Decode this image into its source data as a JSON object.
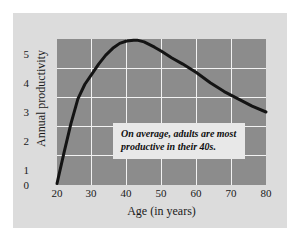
{
  "figure": {
    "card_background": "#dcdcdc",
    "page_background": "#ffffff"
  },
  "callout": {
    "line1": "On average, adults are most",
    "line2": "productive in their 40s.",
    "background": "#e8e8e8"
  },
  "chart_data": {
    "type": "line",
    "title": "",
    "xlabel": "Age (in years)",
    "ylabel": "Annual productivity",
    "xlim": [
      20,
      80
    ],
    "ylim": [
      0,
      5
    ],
    "xticks": [
      20,
      30,
      40,
      50,
      60,
      70,
      80
    ],
    "yticks": [
      0,
      1,
      2,
      3,
      4,
      5
    ],
    "xtick_labels": [
      "20",
      "30",
      "40",
      "50",
      "60",
      "70",
      "80"
    ],
    "ytick_labels": [
      "0",
      "1",
      "2",
      "3",
      "4",
      "5"
    ],
    "grid": true,
    "grid_color": "#f2f2f2",
    "plot_background": "#8c8c8c",
    "legend": false,
    "series": [
      {
        "name": "Annual productivity",
        "color": "#141414",
        "line_width": 3,
        "x": [
          20,
          22,
          24,
          26,
          28,
          30,
          32,
          34,
          36,
          38,
          40,
          42,
          43,
          45,
          48,
          50,
          53,
          56,
          60,
          64,
          68,
          72,
          76,
          80
        ],
        "values": [
          0.05,
          1.1,
          2.1,
          2.95,
          3.45,
          3.8,
          4.15,
          4.45,
          4.68,
          4.85,
          4.93,
          4.96,
          4.96,
          4.9,
          4.72,
          4.58,
          4.35,
          4.15,
          3.85,
          3.5,
          3.2,
          2.95,
          2.7,
          2.5
        ]
      }
    ],
    "annotations": [
      {
        "text": "On average, adults are most productive in their 40s.",
        "x_range": [
          37,
          75
        ],
        "y_range": [
          1.15,
          2.2
        ]
      }
    ]
  }
}
